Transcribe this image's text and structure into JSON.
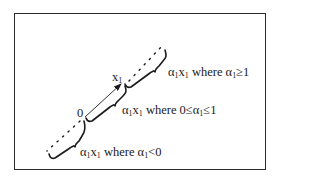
{
  "diagram": {
    "type": "vector-scaling-illustration",
    "frame": {
      "border_color": "#2a2a2a"
    },
    "points": {
      "origin": {
        "label": "0"
      },
      "vector_tip": {
        "label_base": "x",
        "label_sub": "1"
      }
    },
    "regions": [
      {
        "id": "alpha-ge-1",
        "expr_base1": "α",
        "expr_sub1": "1",
        "expr_base2": "x",
        "expr_sub2": "1",
        "where": " where ",
        "cond_base": "α",
        "cond_sub": "1",
        "cond_rest": "≥1"
      },
      {
        "id": "alpha-0-to-1",
        "expr_base1": "α",
        "expr_sub1": "1",
        "expr_base2": "x",
        "expr_sub2": "1",
        "where": " where ",
        "cond_pre": "0≤",
        "cond_base": "α",
        "cond_sub": "1",
        "cond_rest": "≤1"
      },
      {
        "id": "alpha-lt-0",
        "expr_base1": "α",
        "expr_sub1": "1",
        "expr_base2": "x",
        "expr_sub2": "1",
        "where": " where ",
        "cond_base": "α",
        "cond_sub": "1",
        "cond_rest": "<0"
      }
    ]
  }
}
